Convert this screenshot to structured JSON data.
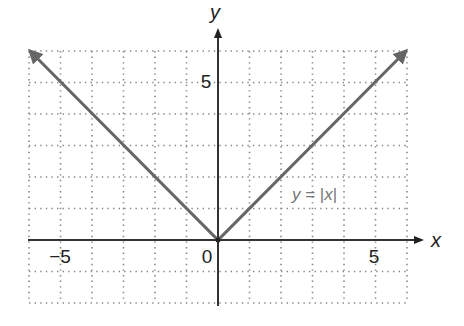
{
  "chart_data": {
    "type": "line",
    "title": "",
    "xlabel": "x",
    "ylabel": "y",
    "xlim": [
      -6,
      6
    ],
    "ylim": [
      -2,
      6
    ],
    "grid": true,
    "grid_style": "dotted",
    "x_ticks_labeled": [
      {
        "value": -5,
        "label": "−5"
      },
      {
        "value": 0,
        "label": "0"
      },
      {
        "value": 5,
        "label": "5"
      }
    ],
    "y_ticks_labeled": [
      {
        "value": 5,
        "label": "5"
      }
    ],
    "series": [
      {
        "name": "y = |x|",
        "x": [
          -6,
          -5,
          -4,
          -3,
          -2,
          -1,
          0,
          1,
          2,
          3,
          4,
          5,
          6
        ],
        "y": [
          6,
          5,
          4,
          3,
          2,
          1,
          0,
          1,
          2,
          3,
          4,
          5,
          6
        ],
        "arrows_at_ends": true,
        "color": "#666666"
      }
    ],
    "annotations": [
      {
        "text": "y = |x|",
        "x": 3,
        "y": 2
      }
    ]
  },
  "labels": {
    "x_axis": "x",
    "y_axis": "y",
    "tick_neg5": "−5",
    "tick_0": "0",
    "tick_5_x": "5",
    "tick_5_y": "5",
    "annot_y": "y",
    "annot_eq": " = |",
    "annot_x": "x",
    "annot_bar": "|"
  },
  "colors": {
    "curve": "#666666",
    "axis": "#333333",
    "grid": "#888888"
  }
}
